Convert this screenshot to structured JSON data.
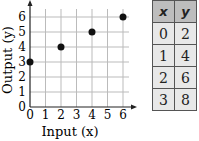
{
  "chart_data": {
    "type": "scatter",
    "title": "",
    "xlabel": "Input (x)",
    "ylabel": "Output (y)",
    "x": [
      0,
      2,
      4,
      6
    ],
    "y": [
      3,
      4,
      5,
      6
    ],
    "xlim": [
      0,
      6
    ],
    "ylim": [
      0,
      6
    ],
    "x_ticks": [
      "0",
      "1",
      "2",
      "3",
      "4",
      "5",
      "6"
    ],
    "y_ticks": [
      "0",
      "1",
      "2",
      "3",
      "4",
      "5",
      "6"
    ],
    "grid": true,
    "legend": null
  },
  "table": {
    "headers": [
      "x",
      "y"
    ],
    "rows": [
      [
        "0",
        "2"
      ],
      [
        "1",
        "4"
      ],
      [
        "2",
        "6"
      ],
      [
        "3",
        "8"
      ]
    ]
  },
  "colors": {
    "points": "#111111",
    "grid": "#bbbbbb",
    "header_bg": "#bdbdbd",
    "cell_bg": "#e8e8e8"
  }
}
